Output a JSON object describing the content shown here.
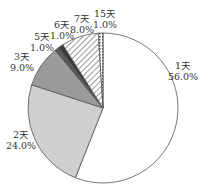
{
  "chart_data": {
    "type": "pie",
    "title": "",
    "categories": [
      "1天",
      "2天",
      "3天",
      "5天",
      "6天",
      "7天",
      "15天"
    ],
    "values": [
      56.0,
      24.0,
      9.0,
      1.0,
      1.0,
      8.0,
      1.0
    ],
    "labels": [
      {
        "name": "1天",
        "pct": "56.0%"
      },
      {
        "name": "2天",
        "pct": "24.0%"
      },
      {
        "name": "3天",
        "pct": "9.0%"
      },
      {
        "name": "5天",
        "pct": "1.0%"
      },
      {
        "name": "6天",
        "pct": "1.0%"
      },
      {
        "name": "7天",
        "pct": "8.0%"
      },
      {
        "name": "15天",
        "pct": "1.0%"
      }
    ],
    "fills": [
      "#ffffff",
      "#cfcfcf",
      "#9a9a9a",
      "#5a5a5a",
      "#3a3a3a",
      "hatch-diagonal",
      "hatch-cross"
    ],
    "start_angle_deg": 0,
    "direction": "clockwise",
    "legend": "none (labels placed outside slices)"
  }
}
